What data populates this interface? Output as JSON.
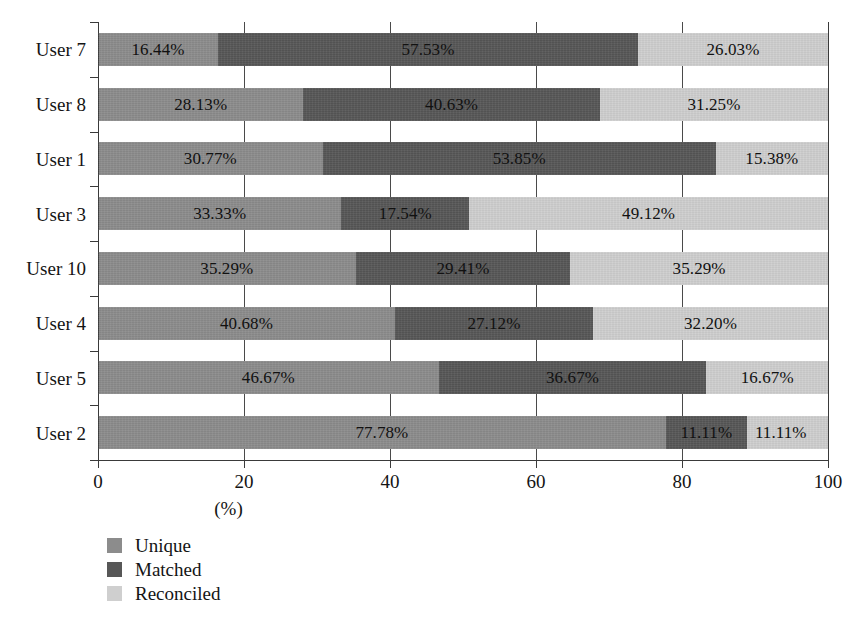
{
  "chart_data": {
    "type": "bar",
    "subtype": "horizontal-stacked-100",
    "title": "",
    "xlabel": "(%)",
    "ylabel": "",
    "xlim": [
      0,
      100
    ],
    "xticks": [
      "0",
      "20",
      "40",
      "60",
      "80",
      "100"
    ],
    "xtick_values": [
      0,
      20,
      40,
      60,
      80,
      100
    ],
    "grid": true,
    "grid_axis": "x",
    "legend_position": "bottom-left",
    "categories": [
      "User 7",
      "User 8",
      "User 1",
      "User 3",
      "User 10",
      "User 4",
      "User 5",
      "User 2"
    ],
    "series": [
      {
        "name": "Unique",
        "color": "#8c8c8c",
        "values": [
          16.44,
          28.13,
          30.77,
          33.33,
          35.29,
          40.68,
          46.67,
          77.78
        ],
        "labels": [
          "16.44%",
          "28.13%",
          "30.77%",
          "33.33%",
          "35.29%",
          "40.68%",
          "46.67%",
          "77.78%"
        ]
      },
      {
        "name": "Matched",
        "color": "#575757",
        "values": [
          57.53,
          40.63,
          53.85,
          17.54,
          29.41,
          27.12,
          36.67,
          11.11
        ],
        "labels": [
          "57.53%",
          "40.63%",
          "53.85%",
          "17.54%",
          "29.41%",
          "27.12%",
          "36.67%",
          "11.11%"
        ]
      },
      {
        "name": "Reconciled",
        "color": "#cfcfcf",
        "values": [
          26.03,
          31.25,
          15.38,
          49.12,
          35.29,
          32.2,
          16.67,
          11.11
        ],
        "labels": [
          "26.03%",
          "31.25%",
          "15.38%",
          "49.12%",
          "35.29%",
          "32.20%",
          "16.67%",
          "11.11%"
        ]
      }
    ]
  },
  "legend": {
    "items": [
      {
        "label": "Unique",
        "color": "#8c8c8c"
      },
      {
        "label": "Matched",
        "color": "#575757"
      },
      {
        "label": "Reconciled",
        "color": "#cfcfcf"
      }
    ]
  },
  "axis": {
    "x_title": "(%)",
    "ticks": [
      "0",
      "20",
      "40",
      "60",
      "80",
      "100"
    ]
  }
}
